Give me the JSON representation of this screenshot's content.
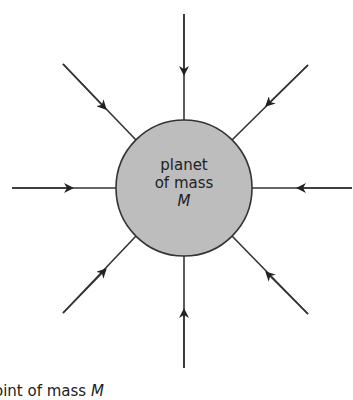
{
  "diagram": {
    "planet": {
      "label_line1": "planet",
      "label_line2": "of mass",
      "label_line3": "M",
      "fill": "#bdbdbd",
      "stroke": "#333333"
    },
    "field_lines": [
      {
        "direction": "top",
        "arrow": "inward"
      },
      {
        "direction": "top-right",
        "arrow": "inward"
      },
      {
        "direction": "right",
        "arrow": "inward"
      },
      {
        "direction": "bottom-right",
        "arrow": "inward"
      },
      {
        "direction": "bottom",
        "arrow": "inward"
      },
      {
        "direction": "bottom-left",
        "arrow": "inward"
      },
      {
        "direction": "left",
        "arrow": "inward"
      },
      {
        "direction": "top-left",
        "arrow": "inward"
      }
    ],
    "caption_prefix": "oint of mass ",
    "caption_symbol": "M"
  }
}
